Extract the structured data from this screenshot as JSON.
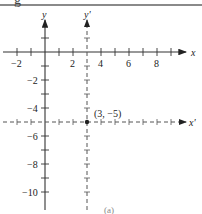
{
  "header": {
    "cropped_title_glyph": "g"
  },
  "diagram": {
    "original_axes": {
      "x_label": "x",
      "y_label": "y"
    },
    "translated_axes": {
      "x_label": "x'",
      "y_label": "y'"
    },
    "new_origin": {
      "x": 3,
      "y": -5,
      "label": "(3, −5)"
    },
    "x_tick_labels": [
      "−2",
      "2",
      "4",
      "6",
      "8"
    ],
    "y_tick_labels": [
      "−2",
      "−4",
      "−6",
      "−8",
      "−10"
    ],
    "colors": {
      "axis": "#333333",
      "dashed_axis": "#555555",
      "rule": "#8a8a8a"
    }
  },
  "caption": {
    "label": "(a)"
  }
}
